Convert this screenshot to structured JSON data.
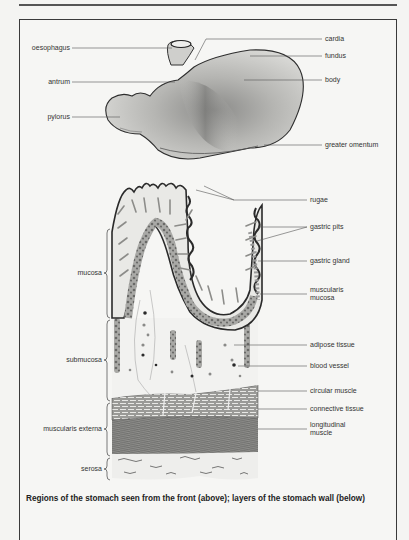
{
  "figure": {
    "caption": "Regions of the stomach seen from the front (above); layers of the stomach wall (below)",
    "top_diagram": {
      "title": "Regions of the stomach (front view)",
      "labels_left": [
        {
          "id": "oesophagus",
          "text": "oesophagus"
        },
        {
          "id": "antrum",
          "text": "antrum"
        },
        {
          "id": "pylorus",
          "text": "pylorus"
        }
      ],
      "labels_right": [
        {
          "id": "cardia",
          "text": "cardia"
        },
        {
          "id": "fundus",
          "text": "fundus"
        },
        {
          "id": "body",
          "text": "body"
        },
        {
          "id": "greater-omentum",
          "text": "greater omentum"
        }
      ]
    },
    "bottom_diagram": {
      "title": "Layers of the stomach wall",
      "layers_left": [
        {
          "id": "mucosa",
          "text": "mucosa"
        },
        {
          "id": "submucosa",
          "text": "submucosa"
        },
        {
          "id": "muscularis-externa",
          "text": "muscularis externa"
        },
        {
          "id": "serosa",
          "text": "serosa"
        }
      ],
      "labels_right": [
        {
          "id": "rugae",
          "text": "rugae"
        },
        {
          "id": "gastric-pits",
          "text": "gastric pits"
        },
        {
          "id": "gastric-gland",
          "text": "gastric gland"
        },
        {
          "id": "muscularis-mucosa",
          "text": "muscularis\nmucosa",
          "line1": "muscularis",
          "line2": "mucosa"
        },
        {
          "id": "adipose-tissue",
          "text": "adipose tissue"
        },
        {
          "id": "blood-vessel",
          "text": "blood vessel"
        },
        {
          "id": "circular-muscle",
          "text": "circular muscle"
        },
        {
          "id": "connective-tissue",
          "text": "connective tissue"
        },
        {
          "id": "longitudinal-muscle",
          "text": "longitudinal\nmuscle",
          "line1": "longitudinal",
          "line2": "muscle"
        }
      ]
    }
  }
}
